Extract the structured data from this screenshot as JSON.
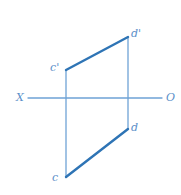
{
  "figure": {
    "kind": "descriptive-geometry-projection",
    "canvas": {
      "width": 181,
      "height": 195,
      "background": "#ffffff"
    },
    "colors": {
      "segment_stroke": "#2e74b5",
      "projector_stroke": "#6fa3d6",
      "axis_stroke": "#6fa3d6",
      "label_text": "#5b8fc9"
    },
    "stroke_widths": {
      "segment": 2.4,
      "projector": 1.3,
      "axis": 1.3
    },
    "ground_line": {
      "left_label": "X",
      "right_label": "O",
      "y": 98,
      "x_start": 28,
      "x_end": 162
    },
    "points": [
      {
        "id": "c-prime",
        "label": "c'",
        "x": 66,
        "y": 70,
        "label_x": 50,
        "label_y": 62,
        "plane": "frontal"
      },
      {
        "id": "d-prime",
        "label": "d'",
        "x": 128,
        "y": 37,
        "label_x": 131,
        "label_y": 28,
        "plane": "frontal"
      },
      {
        "id": "c",
        "label": "c",
        "x": 66,
        "y": 177,
        "label_x": 52,
        "label_y": 172,
        "plane": "horizontal"
      },
      {
        "id": "d",
        "label": "d",
        "x": 128,
        "y": 129,
        "label_x": 131,
        "label_y": 122,
        "plane": "horizontal"
      }
    ],
    "segments": [
      {
        "id": "frontal-projection",
        "from": "c-prime",
        "to": "d-prime",
        "weight": "heavy"
      },
      {
        "id": "horizontal-projection",
        "from": "c",
        "to": "d",
        "weight": "heavy"
      }
    ],
    "projectors": [
      {
        "id": "projector-c",
        "x": 66,
        "y_top": 70,
        "y_bottom": 177
      },
      {
        "id": "projector-d",
        "x": 128,
        "y_top": 37,
        "y_bottom": 129
      }
    ]
  }
}
